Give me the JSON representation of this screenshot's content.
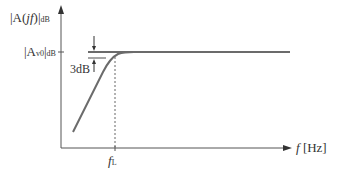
{
  "diagram": {
    "y_axis_label": {
      "prefix": "|A(",
      "var": "jf",
      "suffix": ")|",
      "sub": "dB"
    },
    "midband_label": {
      "prefix": "|A",
      "sub_inner": "v0",
      "suffix": "|",
      "sub": "dB"
    },
    "drop_label": "3dB",
    "x_axis_label": {
      "var": "f",
      "unit": "[Hz]"
    },
    "corner_label": {
      "var": "f",
      "sub": "L"
    },
    "colors": {
      "curve": "#6b6b6b",
      "axis": "#555555",
      "text": "#333333",
      "guide": "#666666"
    }
  }
}
